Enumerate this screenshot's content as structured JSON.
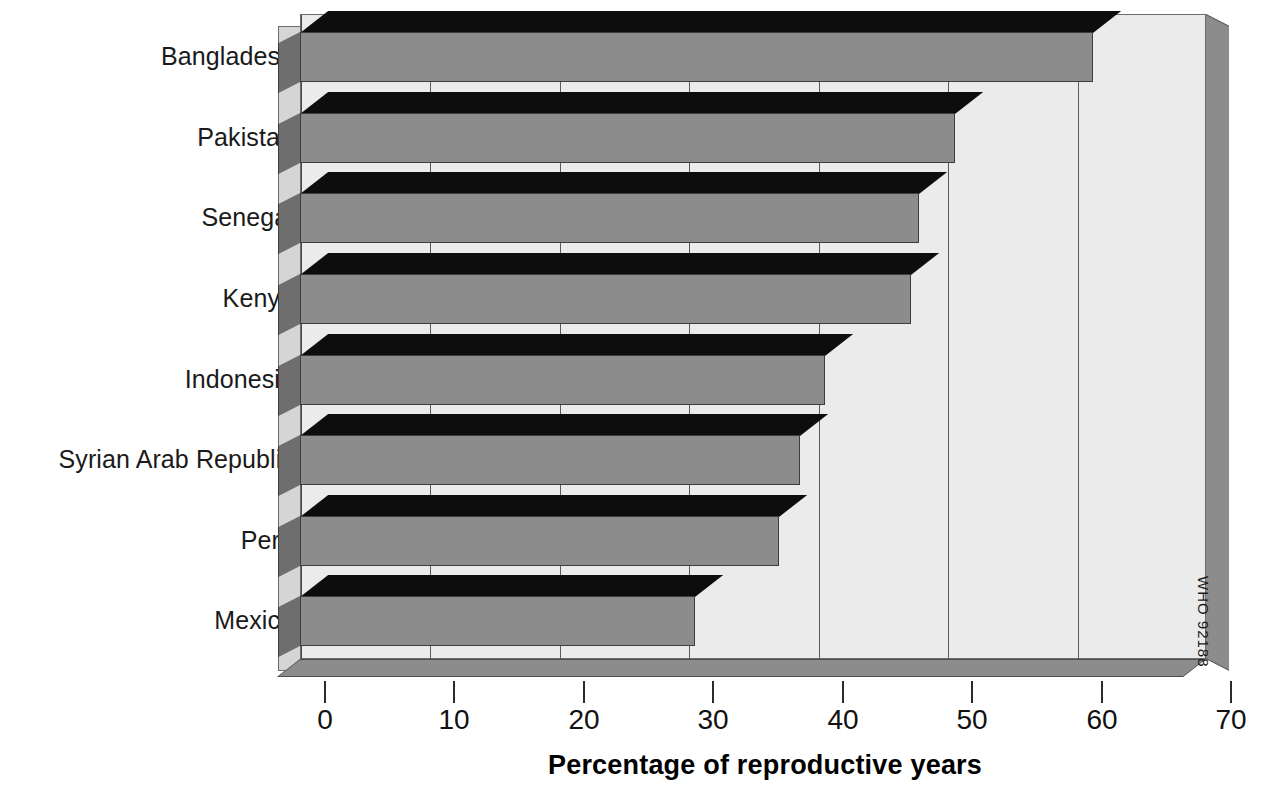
{
  "chart_data": {
    "type": "bar",
    "orientation": "horizontal",
    "title": "",
    "subtitle": "",
    "xlabel": "Percentage of reproductive years",
    "ylabel": "",
    "categories": [
      "Bangladesh",
      "Pakistan",
      "Senegal",
      "Kenya",
      "Indonesia",
      "Syrian Arab Republic",
      "Peru",
      "Mexico"
    ],
    "values": [
      61.3,
      50.6,
      47.8,
      47.2,
      40.6,
      38.6,
      37.0,
      30.5
    ],
    "xlim": [
      0,
      70
    ],
    "xticks": [
      0,
      10,
      20,
      30,
      40,
      50,
      60,
      70
    ],
    "xticklabels": [
      "0",
      "10",
      "20",
      "30",
      "40",
      "50",
      "60",
      "70"
    ],
    "grid": "vertical",
    "legend": "none",
    "style": "3d-bar",
    "annotations": [
      "WHO 92188"
    ]
  },
  "axis": {
    "x_title": "Percentage of reproductive years",
    "tick_labels": [
      "0",
      "10",
      "20",
      "30",
      "40",
      "50",
      "60",
      "70"
    ]
  },
  "credit": {
    "text": "WHO 92188"
  },
  "colors": {
    "bar_front": "#8c8c8c",
    "bar_top": "#0d0d0d",
    "bar_side": "#6e6e6e",
    "plot_background": "#ebebeb",
    "floor": "#8c8c8c",
    "gridline": "#5a5a5a",
    "text": "#111111"
  }
}
